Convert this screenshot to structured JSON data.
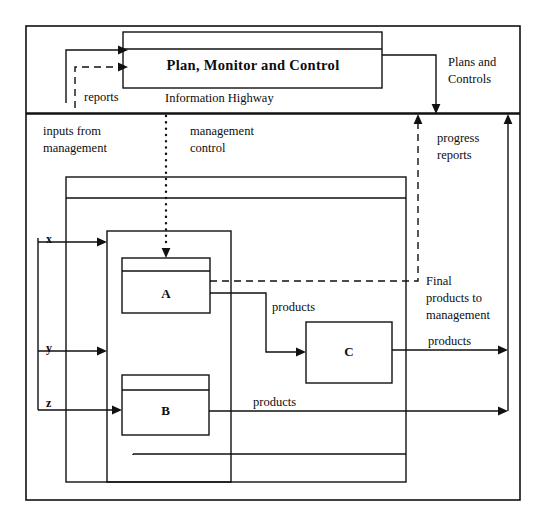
{
  "figure": {
    "type": "block-diagram",
    "stroke_color": "#111111",
    "background": "#ffffff"
  },
  "blocks": {
    "pmc": {
      "label": "Plan, Monitor and Control"
    },
    "a": {
      "label": "A"
    },
    "b": {
      "label": "B"
    },
    "c": {
      "label": "C"
    }
  },
  "labels": {
    "information_highway": "Information Highway",
    "plans_and_controls_1": "Plans and",
    "plans_and_controls_2": "Controls",
    "reports": "reports",
    "inputs_from_1": "inputs from",
    "inputs_from_2": "management",
    "management_control_1": "management",
    "management_control_2": "control",
    "progress_reports_1": "progress",
    "progress_reports_2": "reports",
    "final_products_1": "Final",
    "final_products_2": "products to",
    "final_products_3": "management",
    "products_a": "products",
    "products_b": "products",
    "products_c": "products",
    "products_right": "products",
    "input_x": "x",
    "input_y": "y",
    "input_z": "z"
  }
}
